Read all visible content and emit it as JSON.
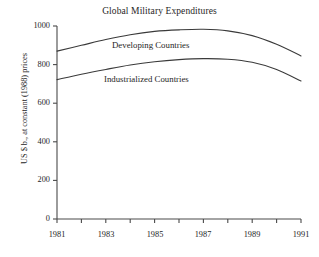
{
  "chart_data": {
    "type": "line",
    "title": "Global Military Expenditures",
    "xlabel": "",
    "ylabel": "US $ b., at constant (1988) prices",
    "x": [
      1981,
      1982,
      1983,
      1984,
      1985,
      1986,
      1987,
      1988,
      1989,
      1990,
      1991
    ],
    "xlim": [
      1981,
      1991
    ],
    "ylim": [
      0,
      1000
    ],
    "xticks": [
      1981,
      1982,
      1983,
      1984,
      1985,
      1986,
      1987,
      1988,
      1989,
      1990,
      1991
    ],
    "xtick_labels": [
      "1981",
      "",
      "1983",
      "",
      "1985",
      "",
      "1987",
      "",
      "1989",
      "",
      "1991"
    ],
    "yticks": [
      0,
      200,
      400,
      600,
      800,
      1000
    ],
    "ytick_labels": [
      "0",
      "200",
      "400",
      "600",
      "800",
      "1000"
    ],
    "grid": false,
    "legend": "inline-labels",
    "series": [
      {
        "name": "Developing Countries",
        "values": [
          870,
          900,
          930,
          955,
          972,
          980,
          983,
          975,
          950,
          905,
          845
        ],
        "color": "#3a3a3a"
      },
      {
        "name": "Industrialized Countries",
        "values": [
          722,
          750,
          775,
          798,
          815,
          826,
          831,
          828,
          812,
          775,
          715
        ],
        "color": "#3a3a3a"
      }
    ],
    "annotations": [
      {
        "text": "Developing Countries",
        "x": 1985.4,
        "y": 905
      },
      {
        "text": "Industrialized Countries",
        "x": 1985.2,
        "y": 730
      }
    ]
  },
  "axis_labels": {
    "y": [
      "1000",
      "800",
      "600",
      "400",
      "200",
      "0"
    ],
    "x": [
      "1981",
      "1983",
      "1985",
      "1987",
      "1989",
      "1991"
    ]
  },
  "colors": {
    "background": "#ffffff",
    "axis": "#4a4a4a",
    "line": "#3a3a3a",
    "text": "#262626"
  }
}
